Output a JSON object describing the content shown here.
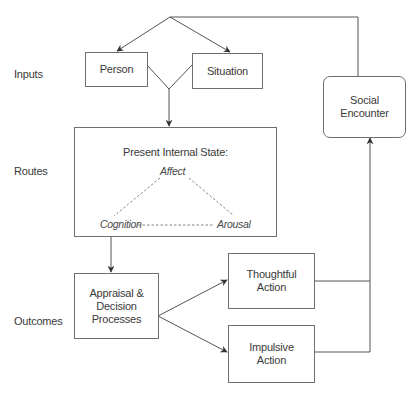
{
  "diagram": {
    "row_labels": {
      "inputs": "Inputs",
      "routes": "Routes",
      "outcomes": "Outcomes"
    },
    "boxes": {
      "person": "Person",
      "situation": "Situation",
      "social_encounter": "Social\nEncounter",
      "internal_state_title": "Present Internal State:",
      "appraisal": "Appraisal &\nDecision\nProcesses",
      "thoughtful_action": "Thoughtful\nAction",
      "impulsive_action": "Impulsive\nAction"
    },
    "internal_state_nodes": {
      "affect": "Affect",
      "cognition": "Cognition",
      "arousal": "Arousal"
    },
    "colors": {
      "line": "#555555",
      "box_border": "#6f6f6f",
      "text": "#3a3a3a"
    }
  }
}
